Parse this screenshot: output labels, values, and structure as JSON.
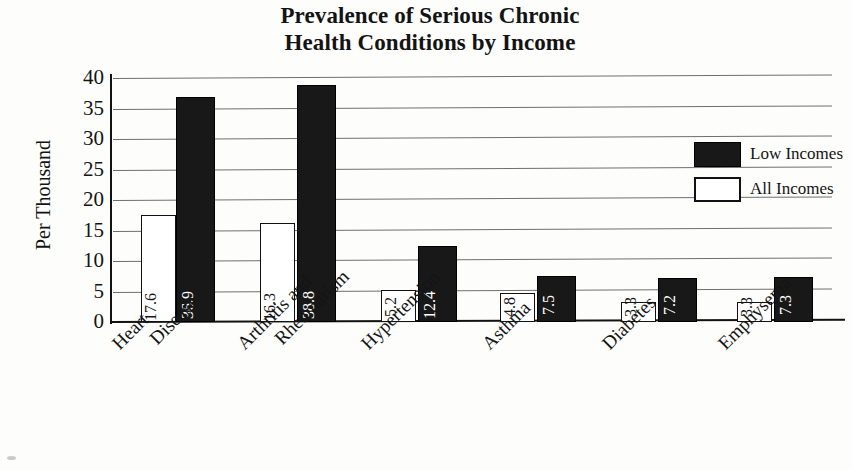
{
  "chart_data": {
    "type": "bar",
    "title": "Prevalence of Serious Chronic Health Conditions by Income",
    "title_lines": [
      "Prevalence of Serious Chronic",
      "Health Conditions by Income"
    ],
    "xlabel": "",
    "ylabel": "Per Thousand",
    "ylim": [
      0,
      40
    ],
    "ytick_step": 5,
    "yticks": [
      "40",
      "35",
      "30",
      "25",
      "20",
      "15",
      "10",
      "5",
      "0"
    ],
    "grid": true,
    "legend_position": "upper right",
    "categories": [
      "Heart Disease",
      "Arthritis and Rheumatism",
      "Hypertension",
      "Asthma",
      "Diabetes",
      "Emphysema"
    ],
    "category_lines": [
      [
        "Heart",
        "Disease"
      ],
      [
        "Arthritis and",
        "Rheumatism"
      ],
      [
        "Hypertension"
      ],
      [
        "Asthma"
      ],
      [
        "Diabetes"
      ],
      [
        "Emphysema"
      ]
    ],
    "series": [
      {
        "name": "All Incomes",
        "color": "#ffffff",
        "edge_color": "#111111",
        "values": [
          17.6,
          16.3,
          5.2,
          4.8,
          3.3,
          3.3
        ],
        "labels": [
          "17.6",
          "16.3",
          "5.2",
          "4.8",
          "3.3",
          "3.3"
        ]
      },
      {
        "name": "Low Incomes",
        "color": "#181818",
        "edge_color": "#000000",
        "values": [
          36.9,
          38.8,
          12.4,
          7.5,
          7.2,
          7.3
        ],
        "labels": [
          "36.9",
          "38.8",
          "12.4",
          "7.5",
          "7.2",
          "7.3"
        ]
      }
    ]
  },
  "legend": {
    "items": [
      {
        "label": "Low Incomes",
        "swatch": "filled-black"
      },
      {
        "label": "All Incomes",
        "swatch": "outlined-white"
      }
    ]
  }
}
